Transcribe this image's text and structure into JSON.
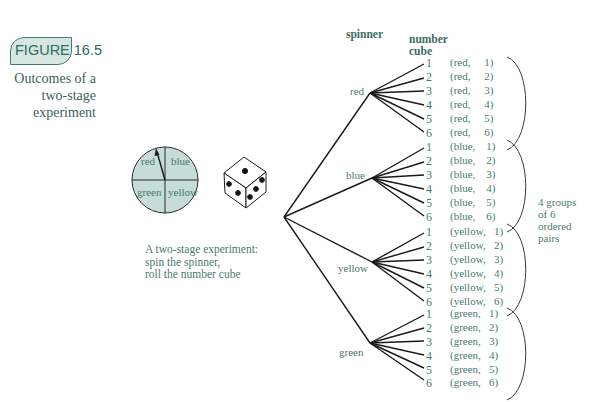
{
  "figure": {
    "badge": "FIGURE 16.5",
    "caption_lines": [
      "Outcomes of a",
      "two-stage",
      "experiment"
    ],
    "sub_caption_lines": [
      "A two-stage experiment:",
      "spin the spinner,",
      "roll the number cube"
    ]
  },
  "spinner": {
    "sectors": [
      "red",
      "blue",
      "green",
      "yellow"
    ],
    "fill_color": "#c6dcd8",
    "pointer_sector": "red"
  },
  "number_cube": {
    "visible_faces": {
      "top": 1,
      "left": 3,
      "right": 3
    }
  },
  "tree": {
    "column_headers": {
      "spinner": "spinner",
      "number_cube_line1": "number",
      "number_cube_line2": "cube"
    },
    "branches": [
      {
        "label": "red",
        "leaves": [
          "1",
          "2",
          "3",
          "4",
          "5",
          "6"
        ],
        "pairs": [
          "(red,     1)",
          "(red,     2)",
          "(red,     3)",
          "(red,     4)",
          "(red,     5)",
          "(red,     6)"
        ]
      },
      {
        "label": "blue",
        "leaves": [
          "1",
          "2",
          "3",
          "4",
          "5",
          "6"
        ],
        "pairs": [
          "(blue,    1)",
          "(blue,    2)",
          "(blue,    3)",
          "(blue,    4)",
          "(blue,    5)",
          "(blue,    6)"
        ]
      },
      {
        "label": "yellow",
        "leaves": [
          "1",
          "2",
          "3",
          "4",
          "5",
          "6"
        ],
        "pairs": [
          "(yellow,   1)",
          "(yellow,   2)",
          "(yellow,   3)",
          "(yellow,   4)",
          "(yellow,   5)",
          "(yellow,   6)"
        ]
      },
      {
        "label": "green",
        "leaves": [
          "1",
          "2",
          "3",
          "4",
          "5",
          "6"
        ],
        "pairs": [
          "(green,   1)",
          "(green,   2)",
          "(green,   3)",
          "(green,   4)",
          "(green,   5)",
          "(green,   6)"
        ]
      }
    ],
    "groups_note_lines": [
      "4 groups",
      "of 6",
      "ordered",
      "pairs"
    ]
  },
  "colors": {
    "text_teal": "#4a7a6f",
    "badge_fill": "#d6e7e2",
    "badge_border": "#3f7d73",
    "line": "#1a1a1a"
  }
}
